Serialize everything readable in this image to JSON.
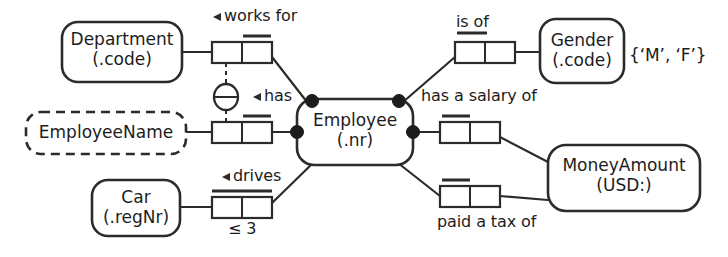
{
  "diagram": {
    "notation": "Object-Role Modeling (ORM 2)",
    "background_color": "#ffffff",
    "line_color": "#2b2b2b"
  },
  "object_types": [
    {
      "id": "department",
      "name": "Department",
      "reference_mode": "(.code)",
      "kind": "entity-type",
      "border": "solid"
    },
    {
      "id": "employeename",
      "name": "EmployeeName",
      "reference_mode": "",
      "kind": "value-type",
      "border": "dashed"
    },
    {
      "id": "car",
      "name": "Car",
      "reference_mode": "(.regNr)",
      "kind": "entity-type",
      "border": "solid"
    },
    {
      "id": "employee",
      "name": "Employee",
      "reference_mode": "(.nr)",
      "kind": "entity-type",
      "border": "solid"
    },
    {
      "id": "gender",
      "name": "Gender",
      "reference_mode": "(.code)",
      "kind": "entity-type",
      "border": "solid"
    },
    {
      "id": "moneyamount",
      "name": "MoneyAmount",
      "reference_mode": "(USD:)",
      "kind": "entity-type",
      "border": "solid"
    }
  ],
  "fact_types": [
    {
      "id": "works-for",
      "predicate": "works for",
      "reading_arrow": "left",
      "roles": 2,
      "uniqueness_over": "second-cell",
      "frequency": ""
    },
    {
      "id": "has",
      "predicate": "has",
      "reading_arrow": "left",
      "roles": 2,
      "uniqueness_over": "second-cell",
      "frequency": ""
    },
    {
      "id": "drives",
      "predicate": "drives",
      "reading_arrow": "left",
      "roles": 2,
      "uniqueness_over": "both-cells",
      "frequency": "≤ 3"
    },
    {
      "id": "is-of",
      "predicate": "is of",
      "reading_arrow": "none",
      "roles": 2,
      "uniqueness_over": "first-cell",
      "frequency": ""
    },
    {
      "id": "has-a-salary-of",
      "predicate": "has a salary of",
      "reading_arrow": "none",
      "roles": 2,
      "uniqueness_over": "first-cell",
      "frequency": ""
    },
    {
      "id": "paid-a-tax-of",
      "predicate": "paid a tax of",
      "reading_arrow": "none",
      "roles": 2,
      "uniqueness_over": "first-cell",
      "frequency": ""
    }
  ],
  "constraints": {
    "value_constraint_gender": "{‘M’, ‘F’}",
    "frequency_drives": "≤ 3",
    "exclusion_circle": "⊖",
    "exclusion_links": [
      "works-for",
      "has"
    ]
  },
  "labels": {
    "works_for": "works for",
    "has": "has",
    "drives": "drives",
    "is_of": "is of",
    "has_a_salary_of": "has a salary of",
    "paid_a_tax_of": "paid a tax of",
    "frequency_drives": "≤ 3",
    "gender_values": "{‘M’, ‘F’}",
    "arrow_glyph": "◄"
  }
}
